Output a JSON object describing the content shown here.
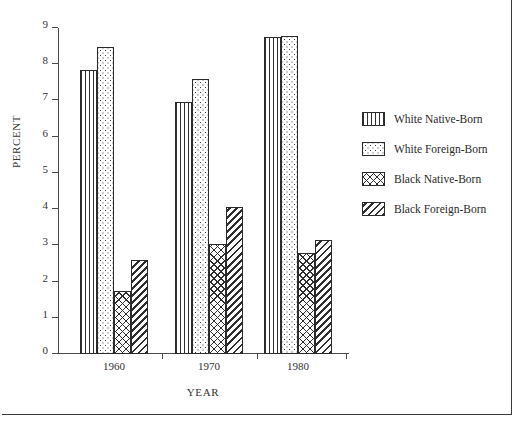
{
  "chart_data": {
    "type": "bar",
    "title": "",
    "xlabel": "YEAR",
    "ylabel": "PERCENT",
    "ylim": [
      0,
      9
    ],
    "yticks": [
      0,
      1,
      2,
      3,
      4,
      5,
      6,
      7,
      8,
      9
    ],
    "grid": false,
    "legend_position": "right",
    "categories": [
      "1960",
      "1970",
      "1980"
    ],
    "series": [
      {
        "name": "White Native-Born",
        "pattern": "vertical-lines",
        "values": [
          7.85,
          6.97,
          8.75
        ]
      },
      {
        "name": "White Foreign-Born",
        "pattern": "dots",
        "values": [
          8.47,
          7.6,
          8.78
        ]
      },
      {
        "name": "Black Native-Born",
        "pattern": "cross-hatch",
        "values": [
          1.75,
          3.05,
          2.8
        ]
      },
      {
        "name": "Black Foreign-Born",
        "pattern": "diagonal-lines",
        "values": [
          2.6,
          4.05,
          3.15
        ]
      }
    ]
  },
  "legend": {
    "items": [
      {
        "label": "White Native-Born"
      },
      {
        "label": "White Foreign-Born"
      },
      {
        "label": "Black Native-Born"
      },
      {
        "label": "Black Foreign-Born"
      }
    ]
  }
}
